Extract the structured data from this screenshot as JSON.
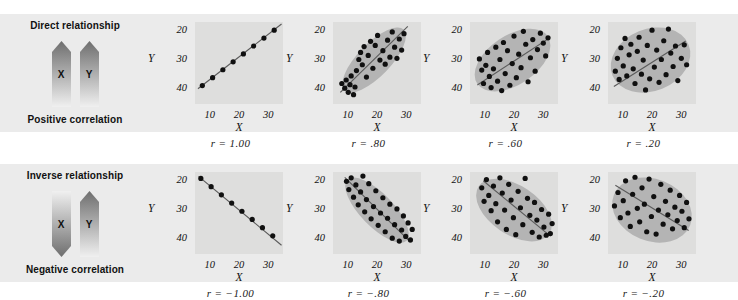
{
  "figure": {
    "background": "#ffffff",
    "band_color": "#ebebeb",
    "panel_color": "#dededd",
    "blob_color": "#b4b4b4",
    "dot_color": "#101010",
    "line_color": "#5a5a5a"
  },
  "rows": [
    {
      "legend": {
        "title": "Direct relationship",
        "footer": "Positive correlation",
        "arrows": [
          {
            "letter": "X",
            "direction": "up"
          },
          {
            "letter": "Y",
            "direction": "up"
          }
        ]
      }
    },
    {
      "legend": {
        "title": "Inverse relationship",
        "footer": "Negative correlation",
        "arrows": [
          {
            "letter": "X",
            "direction": "down"
          },
          {
            "letter": "Y",
            "direction": "up"
          }
        ]
      }
    }
  ],
  "axes": {
    "xlabel": "X",
    "ylabel": "Y",
    "yticks": [
      "40",
      "30",
      "20"
    ],
    "xticks": [
      "10",
      "20",
      "30"
    ],
    "xlim": [
      5,
      35
    ],
    "ylim": [
      15,
      43
    ]
  },
  "chart_data": [
    {
      "type": "scatter",
      "title": "r = 1.00",
      "r": 1.0,
      "xlabel": "X",
      "ylabel": "Y",
      "xlim": [
        5,
        35
      ],
      "ylim": [
        15,
        43
      ],
      "xticks": [
        10,
        20,
        30
      ],
      "yticks": [
        20,
        30,
        40
      ],
      "grid": false,
      "blob": null,
      "fitline": {
        "x1": 6.0,
        "y1": 20.2,
        "x2": 34.5,
        "y2": 42.3
      },
      "points": [
        [
          7.5,
          21.3
        ],
        [
          11.0,
          24.0
        ],
        [
          14.5,
          26.7
        ],
        [
          18.0,
          29.4
        ],
        [
          21.5,
          32.1
        ],
        [
          25.0,
          34.8
        ],
        [
          28.5,
          37.5
        ],
        [
          32.0,
          40.2
        ]
      ]
    },
    {
      "type": "scatter",
      "title": "r = .80",
      "r": 0.8,
      "xlabel": "X",
      "ylabel": "Y",
      "xlim": [
        5,
        35
      ],
      "ylim": [
        15,
        43
      ],
      "xticks": [
        10,
        20,
        30
      ],
      "yticks": [
        20,
        30,
        40
      ],
      "grid": false,
      "blob": {
        "cx": 19.0,
        "cy": 30.0,
        "rx": 14.5,
        "ry": 5.6,
        "rot": -46
      },
      "fitline": {
        "x1": 7.5,
        "y1": 19.0,
        "x2": 30.5,
        "y2": 41.5
      },
      "points": [
        [
          8.0,
          22.0
        ],
        [
          9.0,
          20.4
        ],
        [
          9.5,
          23.2
        ],
        [
          10.2,
          19.0
        ],
        [
          10.8,
          21.6
        ],
        [
          11.2,
          24.6
        ],
        [
          12.0,
          18.2
        ],
        [
          12.5,
          20.8
        ],
        [
          13.0,
          26.4
        ],
        [
          13.8,
          30.2
        ],
        [
          14.4,
          32.6
        ],
        [
          15.0,
          28.4
        ],
        [
          15.6,
          34.6
        ],
        [
          16.4,
          24.2
        ],
        [
          17.0,
          31.6
        ],
        [
          17.8,
          36.4
        ],
        [
          18.6,
          27.2
        ],
        [
          19.4,
          35.0
        ],
        [
          20.2,
          38.4
        ],
        [
          21.0,
          30.0
        ],
        [
          22.0,
          33.2
        ],
        [
          22.8,
          28.6
        ],
        [
          23.6,
          36.8
        ],
        [
          24.4,
          31.0
        ],
        [
          25.2,
          39.6
        ],
        [
          26.0,
          34.4
        ],
        [
          26.8,
          30.6
        ],
        [
          27.6,
          37.2
        ],
        [
          28.4,
          33.4
        ],
        [
          29.2,
          39.0
        ]
      ]
    },
    {
      "type": "scatter",
      "title": "r = .60",
      "r": 0.6,
      "xlabel": "X",
      "ylabel": "Y",
      "xlim": [
        5,
        35
      ],
      "ylim": [
        15,
        43
      ],
      "xticks": [
        10,
        20,
        30
      ],
      "yticks": [
        20,
        30,
        40
      ],
      "grid": false,
      "blob": {
        "cx": 19.5,
        "cy": 30.0,
        "rx": 14.5,
        "ry": 8.4,
        "rot": -34
      },
      "fitline": {
        "x1": 7.5,
        "y1": 21.5,
        "x2": 32.0,
        "y2": 37.5
      },
      "points": [
        [
          8.2,
          30.4
        ],
        [
          9.0,
          26.6
        ],
        [
          9.6,
          22.0
        ],
        [
          10.4,
          28.2
        ],
        [
          11.0,
          32.6
        ],
        [
          11.6,
          24.4
        ],
        [
          12.2,
          20.6
        ],
        [
          13.0,
          27.0
        ],
        [
          13.8,
          34.4
        ],
        [
          14.4,
          22.8
        ],
        [
          15.2,
          30.2
        ],
        [
          15.8,
          19.6
        ],
        [
          16.4,
          36.0
        ],
        [
          17.0,
          25.4
        ],
        [
          17.8,
          33.2
        ],
        [
          18.6,
          21.4
        ],
        [
          19.4,
          28.8
        ],
        [
          20.0,
          38.2
        ],
        [
          20.8,
          24.0
        ],
        [
          21.6,
          32.0
        ],
        [
          22.4,
          27.4
        ],
        [
          23.2,
          39.8
        ],
        [
          24.0,
          35.4
        ],
        [
          24.8,
          22.6
        ],
        [
          25.6,
          30.8
        ],
        [
          26.4,
          37.0
        ],
        [
          27.2,
          26.2
        ],
        [
          28.0,
          33.6
        ],
        [
          29.0,
          39.2
        ],
        [
          30.0,
          35.8
        ],
        [
          30.8,
          31.4
        ],
        [
          31.6,
          37.6
        ]
      ]
    },
    {
      "type": "scatter",
      "title": "r = .20",
      "r": 0.2,
      "xlabel": "X",
      "ylabel": "Y",
      "xlim": [
        5,
        35
      ],
      "ylim": [
        15,
        43
      ],
      "xticks": [
        10,
        20,
        30
      ],
      "yticks": [
        20,
        30,
        40
      ],
      "grid": false,
      "blob": {
        "cx": 19.5,
        "cy": 30.0,
        "rx": 14.0,
        "ry": 10.6,
        "rot": -22
      },
      "fitline": {
        "x1": 7.0,
        "y1": 21.0,
        "x2": 31.5,
        "y2": 36.5
      },
      "points": [
        [
          7.5,
          26.2
        ],
        [
          8.2,
          30.6
        ],
        [
          8.8,
          23.4
        ],
        [
          9.4,
          34.2
        ],
        [
          10.2,
          28.0
        ],
        [
          10.8,
          37.4
        ],
        [
          11.4,
          24.6
        ],
        [
          12.2,
          31.8
        ],
        [
          12.8,
          35.4
        ],
        [
          13.6,
          27.0
        ],
        [
          14.2,
          22.0
        ],
        [
          15.0,
          33.0
        ],
        [
          15.6,
          37.8
        ],
        [
          16.4,
          25.2
        ],
        [
          17.0,
          30.0
        ],
        [
          17.8,
          19.8
        ],
        [
          18.4,
          35.0
        ],
        [
          19.2,
          23.6
        ],
        [
          20.0,
          40.2
        ],
        [
          20.8,
          27.6
        ],
        [
          21.6,
          33.4
        ],
        [
          22.4,
          22.4
        ],
        [
          23.2,
          30.2
        ],
        [
          24.0,
          36.6
        ],
        [
          24.8,
          25.0
        ],
        [
          25.6,
          40.6
        ],
        [
          26.4,
          32.4
        ],
        [
          27.2,
          27.8
        ],
        [
          28.0,
          34.8
        ],
        [
          28.8,
          23.0
        ],
        [
          30.0,
          30.6
        ],
        [
          31.0,
          35.2
        ],
        [
          31.8,
          28.4
        ]
      ]
    },
    {
      "type": "scatter",
      "title": "r = −1.00",
      "r": -1.0,
      "xlabel": "X",
      "ylabel": "Y",
      "xlim": [
        5,
        35
      ],
      "ylim": [
        15,
        43
      ],
      "xticks": [
        10,
        20,
        30
      ],
      "yticks": [
        20,
        30,
        40
      ],
      "grid": false,
      "blob": null,
      "fitline": {
        "x1": 6.2,
        "y1": 41.5,
        "x2": 34.5,
        "y2": 18.0
      },
      "points": [
        [
          7.0,
          40.8
        ],
        [
          10.5,
          38.0
        ],
        [
          14.0,
          35.2
        ],
        [
          17.5,
          32.4
        ],
        [
          21.0,
          29.6
        ],
        [
          24.5,
          26.8
        ],
        [
          28.0,
          24.0
        ],
        [
          31.5,
          21.2
        ]
      ]
    },
    {
      "type": "scatter",
      "title": "r = −.80",
      "r": -0.8,
      "xlabel": "X",
      "ylabel": "Y",
      "xlim": [
        5,
        35
      ],
      "ylim": [
        15,
        43
      ],
      "xticks": [
        10,
        20,
        30
      ],
      "yticks": [
        20,
        30,
        40
      ],
      "grid": false,
      "blob": {
        "cx": 20.0,
        "cy": 30.0,
        "rx": 14.5,
        "ry": 5.6,
        "rot": 46
      },
      "fitline": {
        "x1": 9.0,
        "y1": 41.2,
        "x2": 31.5,
        "y2": 19.0
      },
      "points": [
        [
          9.6,
          39.8
        ],
        [
          10.4,
          37.0
        ],
        [
          11.2,
          41.0
        ],
        [
          12.0,
          34.4
        ],
        [
          12.8,
          38.6
        ],
        [
          13.6,
          31.8
        ],
        [
          14.4,
          36.2
        ],
        [
          15.2,
          41.6
        ],
        [
          15.8,
          29.4
        ],
        [
          16.4,
          33.6
        ],
        [
          17.2,
          39.0
        ],
        [
          18.0,
          27.0
        ],
        [
          18.8,
          31.2
        ],
        [
          19.6,
          36.6
        ],
        [
          20.4,
          24.8
        ],
        [
          21.2,
          29.0
        ],
        [
          22.0,
          34.2
        ],
        [
          22.8,
          22.6
        ],
        [
          23.6,
          27.2
        ],
        [
          24.4,
          32.0
        ],
        [
          25.2,
          20.4
        ],
        [
          26.0,
          25.0
        ],
        [
          26.8,
          30.4
        ],
        [
          27.6,
          19.4
        ],
        [
          28.4,
          23.2
        ],
        [
          29.0,
          28.0
        ],
        [
          29.8,
          21.0
        ],
        [
          30.6,
          25.6
        ],
        [
          31.4,
          19.8
        ],
        [
          32.0,
          23.4
        ]
      ]
    },
    {
      "type": "scatter",
      "title": "r = −.60",
      "r": -0.6,
      "xlabel": "X",
      "ylabel": "Y",
      "xlim": [
        5,
        35
      ],
      "ylim": [
        15,
        43
      ],
      "xticks": [
        10,
        20,
        30
      ],
      "yticks": [
        20,
        30,
        40
      ],
      "grid": false,
      "blob": {
        "cx": 20.0,
        "cy": 30.0,
        "rx": 14.5,
        "ry": 8.4,
        "rot": 34
      },
      "fitline": {
        "x1": 9.5,
        "y1": 40.0,
        "x2": 32.5,
        "y2": 21.0
      },
      "points": [
        [
          9.0,
          37.6
        ],
        [
          9.8,
          33.0
        ],
        [
          10.6,
          40.4
        ],
        [
          11.4,
          35.0
        ],
        [
          12.2,
          29.8
        ],
        [
          13.0,
          38.2
        ],
        [
          13.8,
          32.2
        ],
        [
          14.4,
          26.0
        ],
        [
          15.2,
          41.0
        ],
        [
          16.0,
          35.8
        ],
        [
          16.8,
          30.0
        ],
        [
          17.4,
          23.4
        ],
        [
          18.2,
          38.8
        ],
        [
          19.0,
          33.4
        ],
        [
          19.8,
          27.4
        ],
        [
          20.6,
          21.6
        ],
        [
          21.4,
          36.4
        ],
        [
          22.2,
          30.8
        ],
        [
          23.0,
          25.0
        ],
        [
          23.8,
          40.8
        ],
        [
          24.6,
          34.0
        ],
        [
          25.4,
          28.2
        ],
        [
          26.2,
          22.4
        ],
        [
          27.0,
          32.6
        ],
        [
          27.8,
          26.6
        ],
        [
          28.6,
          20.8
        ],
        [
          29.4,
          30.2
        ],
        [
          30.2,
          24.2
        ],
        [
          31.0,
          21.4
        ],
        [
          31.8,
          28.6
        ],
        [
          32.4,
          22.0
        ],
        [
          33.0,
          25.4
        ]
      ]
    },
    {
      "type": "scatter",
      "title": "r = −.20",
      "r": -0.2,
      "xlabel": "X",
      "ylabel": "Y",
      "xlim": [
        5,
        35
      ],
      "ylim": [
        15,
        43
      ],
      "xticks": [
        10,
        20,
        30
      ],
      "yticks": [
        20,
        30,
        40
      ],
      "grid": false,
      "blob": {
        "cx": 20.0,
        "cy": 30.0,
        "rx": 14.0,
        "ry": 10.6,
        "rot": 22
      },
      "fitline": {
        "x1": 7.5,
        "y1": 38.5,
        "x2": 32.5,
        "y2": 23.0
      },
      "points": [
        [
          7.2,
          31.4
        ],
        [
          8.4,
          36.0
        ],
        [
          9.2,
          27.4
        ],
        [
          10.2,
          33.2
        ],
        [
          11.0,
          40.0
        ],
        [
          11.8,
          29.0
        ],
        [
          12.6,
          24.4
        ],
        [
          13.4,
          35.4
        ],
        [
          14.2,
          41.2
        ],
        [
          15.0,
          30.6
        ],
        [
          15.8,
          26.0
        ],
        [
          16.6,
          37.6
        ],
        [
          17.4,
          32.0
        ],
        [
          18.2,
          22.6
        ],
        [
          19.0,
          40.6
        ],
        [
          19.8,
          27.8
        ],
        [
          20.6,
          34.6
        ],
        [
          21.4,
          21.8
        ],
        [
          22.2,
          30.0
        ],
        [
          23.0,
          38.8
        ],
        [
          23.8,
          25.2
        ],
        [
          24.6,
          33.0
        ],
        [
          25.4,
          28.4
        ],
        [
          26.2,
          36.8
        ],
        [
          27.0,
          23.6
        ],
        [
          27.8,
          31.0
        ],
        [
          28.6,
          26.4
        ],
        [
          29.4,
          35.0
        ],
        [
          30.2,
          29.6
        ],
        [
          31.0,
          24.0
        ],
        [
          31.8,
          32.6
        ],
        [
          32.6,
          27.0
        ]
      ]
    }
  ]
}
